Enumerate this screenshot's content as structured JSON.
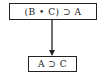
{
  "diagram": {
    "nodes": [
      {
        "id": "premise",
        "label": "(B • C) ⊃ A"
      },
      {
        "id": "conclusion",
        "label": "A ⊃ C"
      }
    ],
    "edges": [
      {
        "from": "premise",
        "to": "conclusion",
        "type": "arrow"
      }
    ],
    "colors": {
      "stroke": "#222222",
      "background": "#ffffff"
    }
  }
}
